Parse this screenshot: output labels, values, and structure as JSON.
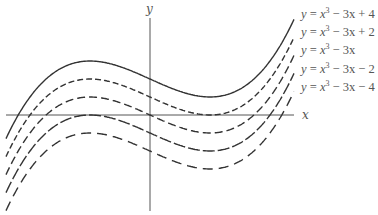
{
  "chart_data": {
    "type": "line",
    "title": "",
    "xlabel": "x",
    "ylabel": "y",
    "grid": false,
    "legend_position": "right (labels beside curve ends)",
    "x_range": [
      -2.4,
      2.4
    ],
    "y_range": [
      -10.6,
      10.6
    ],
    "series": [
      {
        "name": "y = x^3 − 3x + 4",
        "constant": 4,
        "style": "solid",
        "points": [
          [
            -2.37,
            -2.2
          ],
          [
            -2,
            2
          ],
          [
            -1,
            6
          ],
          [
            0,
            4
          ],
          [
            1,
            2
          ],
          [
            2,
            6
          ],
          [
            2.38,
            10.3
          ]
        ]
      },
      {
        "name": "y = x^3 − 3x + 2",
        "constant": 2,
        "style": "dashed-short",
        "points": [
          [
            -2.4,
            -4.6
          ],
          [
            -2,
            0
          ],
          [
            -1,
            4
          ],
          [
            0,
            2
          ],
          [
            1,
            0
          ],
          [
            2,
            4
          ],
          [
            2.4,
            6.6
          ]
        ]
      },
      {
        "name": "y = x^3 − 3x",
        "constant": 0,
        "style": "dashed-medium",
        "points": [
          [
            -2.4,
            -6.6
          ],
          [
            -2,
            -2
          ],
          [
            -1,
            2
          ],
          [
            0,
            0
          ],
          [
            1,
            -2
          ],
          [
            2,
            2
          ],
          [
            2.4,
            4.6
          ]
        ]
      },
      {
        "name": "y = x^3 − 3x − 2",
        "constant": -2,
        "style": "dashed-long",
        "points": [
          [
            -2.4,
            -8.6
          ],
          [
            -2,
            -4
          ],
          [
            -1,
            0
          ],
          [
            0,
            -2
          ],
          [
            1,
            -4
          ],
          [
            2,
            0
          ],
          [
            2.4,
            2.6
          ]
        ]
      },
      {
        "name": "y = x^3 − 3x − 4",
        "constant": -4,
        "style": "dashed-longest",
        "points": [
          [
            -2.4,
            -10.6
          ],
          [
            -2,
            -6
          ],
          [
            -1,
            -2
          ],
          [
            0,
            -4
          ],
          [
            1,
            -6
          ],
          [
            2,
            -2
          ],
          [
            2.4,
            0.6
          ]
        ]
      }
    ],
    "annotations": [
      "x",
      "y"
    ]
  },
  "axes": {
    "x_label": "x",
    "y_label": "y"
  },
  "legend": {
    "items": [
      {
        "lhs": "y",
        "base": "x",
        "exp": "3",
        "rest": " − 3x + 4"
      },
      {
        "lhs": "y",
        "base": "x",
        "exp": "3",
        "rest": " − 3x + 2"
      },
      {
        "lhs": "y",
        "base": "x",
        "exp": "3",
        "rest": " − 3x"
      },
      {
        "lhs": "y",
        "base": "x",
        "exp": "3",
        "rest": " − 3x − 2"
      },
      {
        "lhs": "y",
        "base": "x",
        "exp": "3",
        "rest": " − 3x − 4"
      }
    ]
  },
  "colors": {
    "curve": "#333333",
    "axis": "#555555",
    "text": "#555555"
  }
}
